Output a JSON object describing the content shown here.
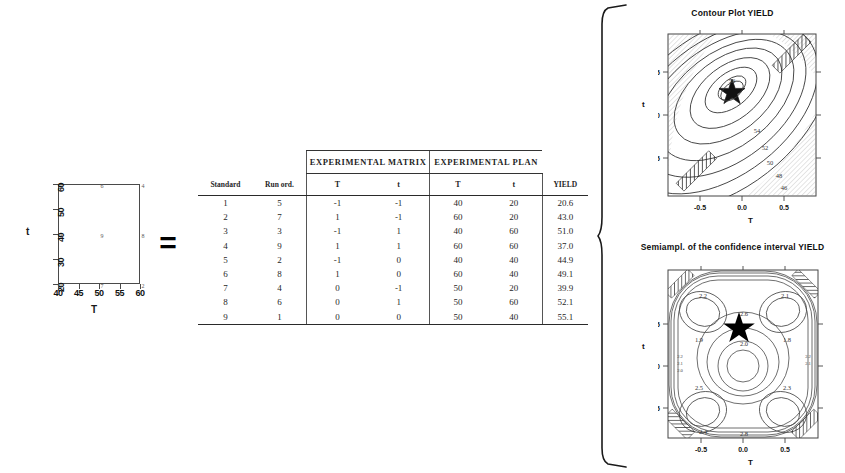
{
  "design_plot": {
    "name": "factorial design layout",
    "x_axis_label": "T",
    "y_axis_label": "t",
    "x_ticks": [
      "40",
      "45",
      "50",
      "55",
      "60"
    ],
    "y_ticks": [
      "60",
      "50",
      "40",
      "30",
      "20"
    ],
    "points": [
      {
        "label": "5",
        "T": 40,
        "t": 60
      },
      {
        "label": "6",
        "T": 50,
        "t": 60
      },
      {
        "label": "4",
        "T": 60,
        "t": 60
      },
      {
        "label": "3",
        "T": 40,
        "t": 40
      },
      {
        "label": "9",
        "T": 50,
        "t": 40
      },
      {
        "label": "8",
        "T": 60,
        "t": 40
      },
      {
        "label": "1",
        "T": 40,
        "t": 20
      },
      {
        "label": "7",
        "T": 50,
        "t": 20
      },
      {
        "label": "2",
        "T": 60,
        "t": 20
      }
    ]
  },
  "equals": {
    "symbol": "="
  },
  "table": {
    "group_headers": [
      "EXPERIMENTAL  MATRIX",
      "EXPERIMENTAL  PLAN"
    ],
    "columns": [
      "Standard",
      "Run ord.",
      "T",
      "t",
      "T",
      "t",
      "YIELD"
    ],
    "rows": [
      [
        "1",
        "5",
        "-1",
        "-1",
        "40",
        "20",
        "20.6"
      ],
      [
        "2",
        "7",
        "1",
        "-1",
        "60",
        "20",
        "43.0"
      ],
      [
        "3",
        "3",
        "-1",
        "1",
        "40",
        "60",
        "51.0"
      ],
      [
        "4",
        "9",
        "1",
        "1",
        "60",
        "60",
        "37.0"
      ],
      [
        "5",
        "2",
        "-1",
        "0",
        "40",
        "40",
        "44.9"
      ],
      [
        "6",
        "8",
        "1",
        "0",
        "60",
        "40",
        "49.1"
      ],
      [
        "7",
        "4",
        "0",
        "-1",
        "50",
        "20",
        "39.9"
      ],
      [
        "8",
        "6",
        "0",
        "1",
        "50",
        "60",
        "52.1"
      ],
      [
        "9",
        "1",
        "0",
        "0",
        "50",
        "40",
        "55.1"
      ]
    ]
  },
  "contour_yield": {
    "title": "Contour Plot YIELD",
    "x_axis_label": "T",
    "y_axis_label": "t",
    "x_ticks": [
      "-0.5",
      "0.0",
      "0.5"
    ],
    "y_ticks": [
      "0.5",
      "0.0",
      "-0.5"
    ],
    "contour_labels": [
      "56",
      "54",
      "52",
      "50",
      "48",
      "46"
    ],
    "marker": "star",
    "marker_style": "open-star"
  },
  "contour_ci": {
    "title": "Semiampl. of the confidence interval YIELD",
    "x_axis_label": "T",
    "y_axis_label": "t",
    "x_ticks": [
      "-0.5",
      "0.0",
      "0.5"
    ],
    "y_ticks": [
      "0.5",
      "0.0",
      "-0.5"
    ],
    "contour_labels": [
      "2.6",
      "2.2",
      "2.1",
      "2.0",
      "2.4",
      "2.8",
      "2.5",
      "2.3",
      "1.9",
      "1.8"
    ],
    "marker": "star",
    "marker_style": "filled-star"
  },
  "brace": {
    "name": "right-curly-brace"
  },
  "chart_data": [
    {
      "type": "contour",
      "title": "Contour Plot YIELD",
      "xlabel": "T",
      "ylabel": "t",
      "xlim": [
        -1,
        1
      ],
      "ylim": [
        -1,
        1
      ],
      "xticks": [
        -0.5,
        0.0,
        0.5
      ],
      "yticks": [
        -0.5,
        0.0,
        0.5
      ],
      "levels": [
        46,
        48,
        50,
        52,
        54,
        56
      ],
      "optimum": {
        "x": -0.05,
        "y": 0.35,
        "marker": "star"
      },
      "grid": false,
      "legend": "none",
      "annotations": [
        "hatched exclusion bands at upper-right and lower-left corners"
      ]
    },
    {
      "type": "contour",
      "title": "Semiampl. of the confidence interval YIELD",
      "xlabel": "T",
      "ylabel": "t",
      "xlim": [
        -1,
        1
      ],
      "ylim": [
        -1,
        1
      ],
      "xticks": [
        -0.5,
        0.0,
        0.5
      ],
      "yticks": [
        -0.5,
        0.0,
        0.5
      ],
      "levels": [
        1.8,
        1.9,
        2.0,
        2.1,
        2.2,
        2.3,
        2.4,
        2.5,
        2.6,
        2.8
      ],
      "optimum": {
        "x": -0.05,
        "y": 0.35,
        "marker": "star"
      },
      "grid": false,
      "legend": "none",
      "annotations": [
        "four symmetric lobes",
        "hatched patches at all four corners"
      ]
    },
    {
      "type": "scatter",
      "title": "",
      "xlabel": "T",
      "ylabel": "t",
      "xlim": [
        38,
        62
      ],
      "ylim": [
        18,
        62
      ],
      "xticks": [
        40,
        45,
        50,
        55,
        60
      ],
      "yticks": [
        20,
        30,
        40,
        50,
        60
      ],
      "x": [
        40,
        50,
        60,
        40,
        50,
        60,
        40,
        50,
        60
      ],
      "y": [
        60,
        60,
        60,
        40,
        40,
        40,
        20,
        20,
        20
      ],
      "point_labels": [
        "5",
        "6",
        "4",
        "3",
        "9",
        "8",
        "1",
        "7",
        "2"
      ],
      "grid": false,
      "legend": "none"
    },
    {
      "type": "table",
      "title": "",
      "categories": [
        "Standard",
        "Run ord.",
        "T (matrix)",
        "t (matrix)",
        "T (plan)",
        "t (plan)",
        "YIELD"
      ],
      "values": [
        [
          "1",
          "5",
          -1,
          -1,
          40,
          20,
          20.6
        ],
        [
          "2",
          "7",
          1,
          -1,
          60,
          20,
          43.0
        ],
        [
          "3",
          "3",
          -1,
          1,
          40,
          60,
          51.0
        ],
        [
          "4",
          "9",
          1,
          1,
          60,
          60,
          37.0
        ],
        [
          "5",
          "2",
          -1,
          0,
          40,
          40,
          44.9
        ],
        [
          "6",
          "8",
          1,
          0,
          60,
          40,
          49.1
        ],
        [
          "7",
          "4",
          0,
          -1,
          50,
          20,
          39.9
        ],
        [
          "8",
          "6",
          0,
          1,
          50,
          60,
          52.1
        ],
        [
          "9",
          "1",
          0,
          0,
          50,
          40,
          55.1
        ]
      ]
    }
  ]
}
